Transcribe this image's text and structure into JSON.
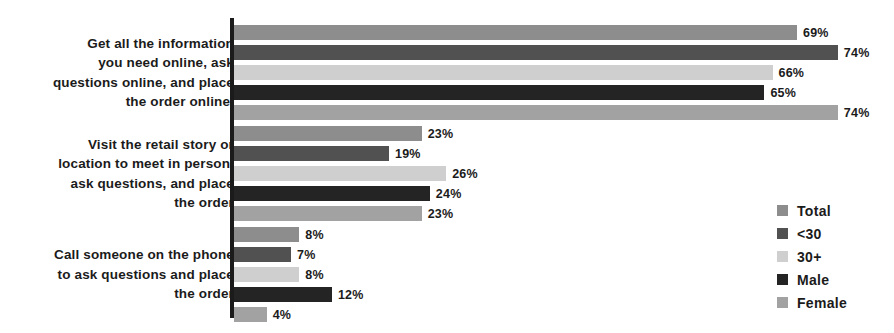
{
  "chart_data": {
    "type": "bar",
    "orientation": "horizontal",
    "title": "",
    "xlabel": "",
    "ylabel": "",
    "xlim": [
      0,
      80
    ],
    "grid": false,
    "value_suffix": "%",
    "legend_position": "bottom-right",
    "categories": [
      "Get all the information\nyou need online, ask\nquestions online, and place\nthe order online.",
      "Visit the retail story or\nlocation to meet in person,\nask questions, and place\nthe order",
      "Call someone on the phone\nto ask questions and place\nthe order"
    ],
    "series": [
      {
        "name": "Total",
        "color": "#8d8d8d",
        "values": [
          69,
          23,
          8
        ]
      },
      {
        "name": "<30",
        "color": "#515151",
        "values": [
          74,
          19,
          7
        ]
      },
      {
        "name": "30+",
        "color": "#cfcfcf",
        "values": [
          66,
          26,
          8
        ]
      },
      {
        "name": "Male",
        "color": "#242424",
        "values": [
          65,
          24,
          12
        ]
      },
      {
        "name": "Female",
        "color": "#a2a2a2",
        "values": [
          74,
          23,
          4
        ]
      }
    ],
    "value_labels": [
      [
        "69%",
        "74%",
        "66%",
        "65%",
        "74%"
      ],
      [
        "23%",
        "19%",
        "26%",
        "24%",
        "23%"
      ],
      [
        "8%",
        "7%",
        "8%",
        "12%",
        "4%"
      ]
    ],
    "legend": [
      {
        "label": "Total",
        "color": "#8d8d8d"
      },
      {
        "label": "<30",
        "color": "#515151"
      },
      {
        "label": "30+",
        "color": "#cfcfcf"
      },
      {
        "label": "Male",
        "color": "#242424"
      },
      {
        "label": "Female",
        "color": "#a2a2a2"
      }
    ],
    "axis_color": "#1b1b1b"
  }
}
